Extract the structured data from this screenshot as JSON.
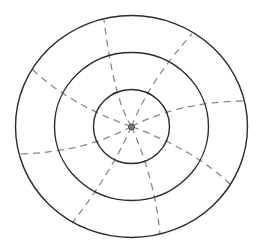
{
  "diagram": {
    "title": "",
    "colors": {
      "background": "#ffffff",
      "ring_stroke": "#2b2b2b",
      "spoke_stroke": "#8a8a8a",
      "hub_fill": "#7a7a7a"
    },
    "center": {
      "cx": 131.5,
      "cy": 126.5
    },
    "rings": [
      {
        "name": "inner",
        "rx": 38,
        "ry": 37
      },
      {
        "name": "middle",
        "rx": 77,
        "ry": 74
      },
      {
        "name": "outer",
        "rx": 116,
        "ry": 111
      }
    ],
    "hub": {
      "r": 3
    },
    "spokes": [
      {
        "name": "spoke-top",
        "d": "M131.5,126.5 Q114,100 104,20"
      },
      {
        "name": "spoke-upper-right",
        "d": "M131.5,126.5 Q150,80 192,34"
      },
      {
        "name": "spoke-right",
        "d": "M131.5,126.5 Q180,102 243,101"
      },
      {
        "name": "spoke-lower-right",
        "d": "M131.5,126.5 Q195,150 231,185"
      },
      {
        "name": "spoke-bottom",
        "d": "M131.5,126.5 Q155,180 160,234"
      },
      {
        "name": "spoke-lower-left",
        "d": "M131.5,126.5 Q110,175 72,223"
      },
      {
        "name": "spoke-left",
        "d": "M131.5,126.5 Q85,152 20,154"
      },
      {
        "name": "spoke-upper-left",
        "d": "M131.5,126.5 Q70,105 32,69"
      }
    ]
  }
}
